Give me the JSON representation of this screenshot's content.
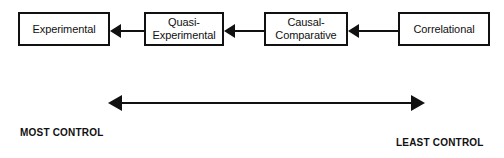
{
  "diagram": {
    "accent_color": "#111111",
    "background_color": "#ffffff",
    "nodes": [
      {
        "id": "experimental",
        "label": "Experimental"
      },
      {
        "id": "quasi",
        "label": "Quasi-\nExperimental"
      },
      {
        "id": "causal",
        "label": "Causal-\nComparative"
      },
      {
        "id": "correlational",
        "label": "Correlational"
      }
    ],
    "connectors": [
      {
        "id": "quasi-to-experimental",
        "direction": "left",
        "from": "Quasi-Experimental",
        "to": "Experimental"
      },
      {
        "id": "causal-to-quasi",
        "direction": "left",
        "from": "Causal-Comparative",
        "to": "Quasi-Experimental"
      },
      {
        "id": "corr-to-causal",
        "direction": "left",
        "from": "Correlational",
        "to": "Causal-Comparative"
      }
    ],
    "spectrum": {
      "arrow_type": "double-headed",
      "left_caption": "MOST CONTROL",
      "right_caption": "LEAST CONTROL"
    }
  }
}
